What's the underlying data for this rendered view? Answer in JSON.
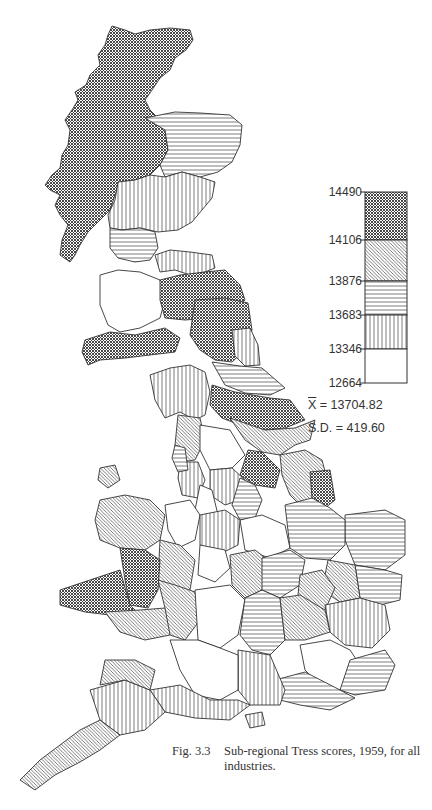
{
  "figure": {
    "caption_number": "Fig. 3.3",
    "caption_line1": "Sub-regional Tress scores, 1959, for all",
    "caption_line2": "industries."
  },
  "legend": {
    "breaks": [
      "14490",
      "14106",
      "13876",
      "13683",
      "13346",
      "12664"
    ],
    "classes": [
      {
        "range": "14106–14490",
        "pattern": "cross-hatch (dark)"
      },
      {
        "range": "13876–14106",
        "pattern": "diagonal hatch"
      },
      {
        "range": "13683–13876",
        "pattern": "horizontal lines"
      },
      {
        "range": "13346–13683",
        "pattern": "vertical lines"
      },
      {
        "range": "12664–13346",
        "pattern": "blank"
      }
    ],
    "mean_label": "X",
    "mean_value": "= 13704.82",
    "sd_label": "S.D.",
    "sd_value": "= 419.60"
  },
  "colors": {
    "ink": "#333333",
    "paper": "#ffffff"
  }
}
